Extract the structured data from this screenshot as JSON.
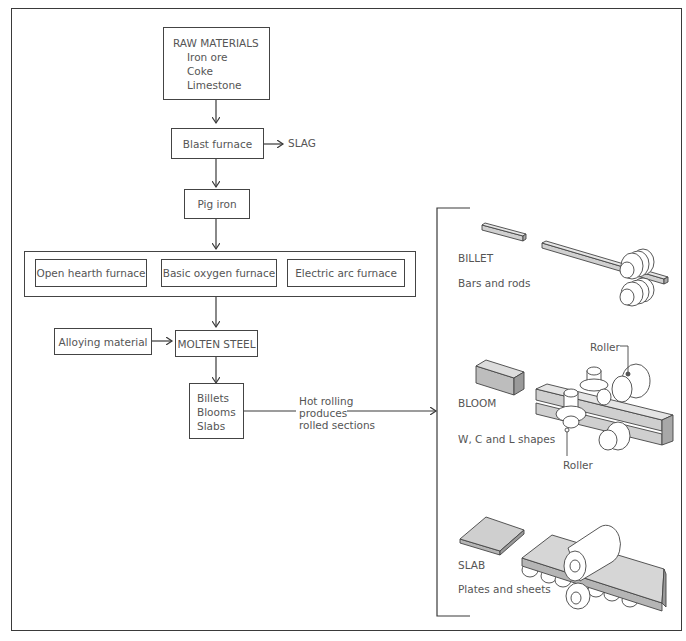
{
  "diagram": {
    "raw_materials": {
      "heading": "RAW MATERIALS",
      "items": [
        "Iron ore",
        "Coke",
        "Limestone"
      ]
    },
    "blast_furnace": "Blast furnace",
    "slag": "SLAG",
    "pig_iron": "Pig iron",
    "furnaces": [
      "Open hearth furnace",
      "Basic oxygen furnace",
      "Electric arc furnace"
    ],
    "alloying_material": "Alloying material",
    "molten_steel": "MOLTEN STEEL",
    "semi_finished": [
      "Billets",
      "Blooms",
      "Slabs"
    ],
    "hot_rolling": [
      "Hot rolling",
      "produces",
      "rolled sections"
    ],
    "products": [
      {
        "name": "BILLET",
        "output": "Bars and rods"
      },
      {
        "name": "BLOOM",
        "output": "W, C and L shapes",
        "labels": [
          "Roller",
          "Roller"
        ]
      },
      {
        "name": "SLAB",
        "output": "Plates and sheets"
      }
    ]
  },
  "colors": {
    "stroke": "#3a3a3a",
    "text": "#555555",
    "fill_light": "#d9d9d9",
    "fill_mid": "#bdbdbd"
  }
}
